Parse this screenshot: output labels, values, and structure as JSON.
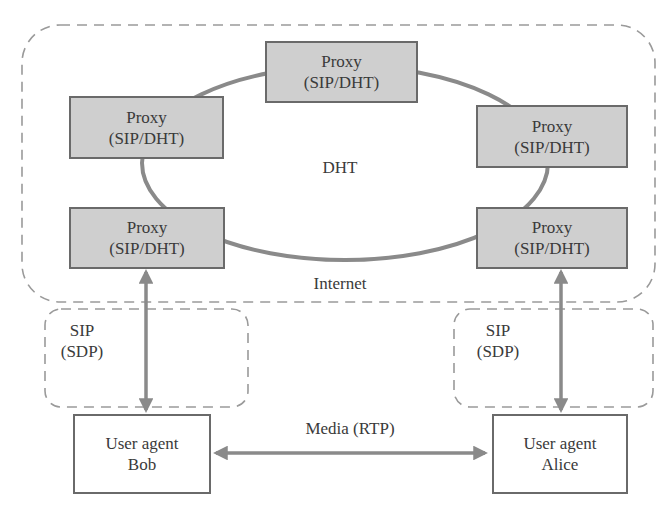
{
  "diagram": {
    "colors": {
      "proxy_fill": "#cfcfcf",
      "border": "#6a6a6a",
      "ring": "#8a8a8a",
      "dashed": "#9a9a9a",
      "arrow": "#8a8a8a",
      "text": "#3a3a3a"
    },
    "regions": {
      "internet": {
        "label": "Internet"
      },
      "dht": {
        "label": "DHT"
      },
      "sip_left": {
        "line1": "SIP",
        "line2": "(SDP)"
      },
      "sip_right": {
        "line1": "SIP",
        "line2": "(SDP)"
      }
    },
    "proxies": [
      {
        "id": "top",
        "line1": "Proxy",
        "line2": "(SIP/DHT)"
      },
      {
        "id": "left-upper",
        "line1": "Proxy",
        "line2": "(SIP/DHT)"
      },
      {
        "id": "left-lower",
        "line1": "Proxy",
        "line2": "(SIP/DHT)"
      },
      {
        "id": "right-upper",
        "line1": "Proxy",
        "line2": "(SIP/DHT)"
      },
      {
        "id": "right-lower",
        "line1": "Proxy",
        "line2": "(SIP/DHT)"
      }
    ],
    "user_agents": [
      {
        "id": "bob",
        "line1": "User agent",
        "line2": "Bob"
      },
      {
        "id": "alice",
        "line1": "User agent",
        "line2": "Alice"
      }
    ],
    "links": {
      "media": {
        "label": "Media (RTP)",
        "from": "bob",
        "to": "alice",
        "bidirectional": true
      },
      "sip_bob": {
        "from": "left-lower",
        "to": "bob",
        "bidirectional": true
      },
      "sip_alice": {
        "from": "right-lower",
        "to": "alice",
        "bidirectional": true
      }
    }
  }
}
